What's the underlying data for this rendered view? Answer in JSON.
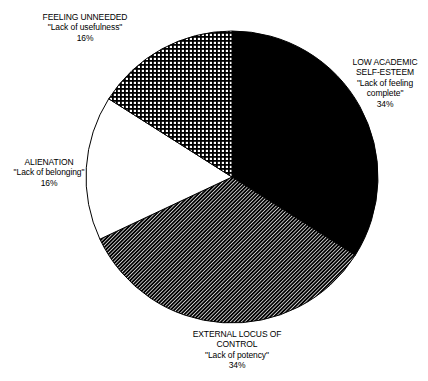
{
  "chart_data": {
    "type": "pie",
    "direction": "clockwise",
    "start_angle_deg": 0,
    "unit": "percent",
    "pie_geometry": {
      "cx": 232,
      "cy": 177,
      "r": 146
    },
    "colors": {
      "ink": "#000000",
      "paper": "#ffffff"
    },
    "segments": [
      {
        "id": "low-academic-self-esteem",
        "category": "LOW ACADEMIC SELF-ESTEEM",
        "quote": "\"Lack of feeling complete\"",
        "value": 34,
        "pattern": "solid-black",
        "label_lines": [
          "LOW ACADEMIC",
          "SELF-ESTEEM",
          "\"Lack of feeling",
          "complete\"",
          "34%"
        ]
      },
      {
        "id": "external-locus-of-control",
        "category": "EXTERNAL LOCUS OF CONTROL",
        "quote": "\"Lack of potency\"",
        "value": 34,
        "pattern": "diagonal-hatch",
        "label_lines": [
          "EXTERNAL LOCUS OF",
          "CONTROL",
          "\"Lack of potency\"",
          "34%"
        ]
      },
      {
        "id": "alienation",
        "category": "ALIENATION",
        "quote": "\"Lack of belonging\"",
        "value": 16,
        "pattern": "white",
        "label_lines": [
          "ALIENATION",
          "\"Lack of belonging\"",
          "16%"
        ]
      },
      {
        "id": "feeling-unneeded",
        "category": "FEELING UNNEEDED",
        "quote": "\"Lack of usefulness\"",
        "value": 16,
        "pattern": "crosshatch",
        "label_lines": [
          "FEELING UNNEEDED",
          "\"Lack of usefulness\"",
          "16%"
        ]
      }
    ]
  }
}
